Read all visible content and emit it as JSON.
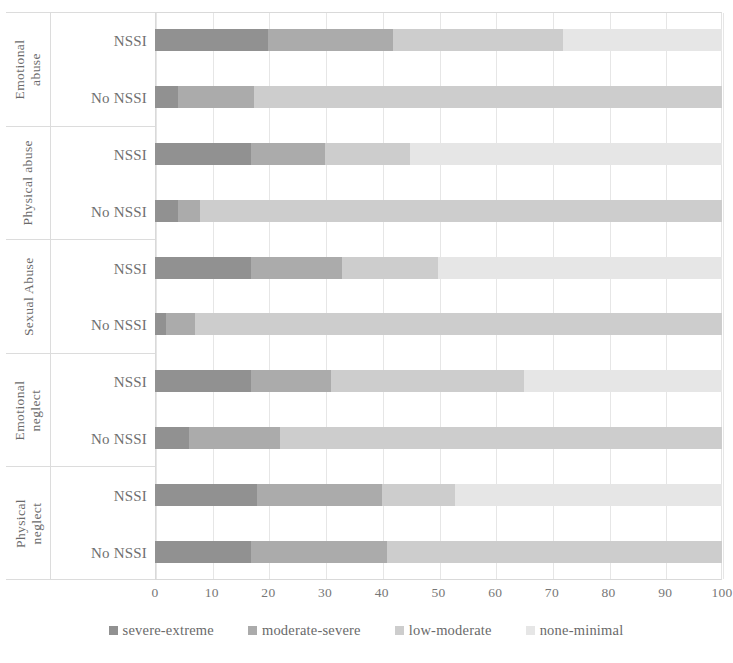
{
  "chart_data": {
    "type": "bar",
    "orientation": "horizontal",
    "stacked": true,
    "stack_mode": "percent",
    "title": "",
    "subtitle": "",
    "xlabel": "",
    "ylabel": "",
    "xlim": [
      0,
      100
    ],
    "xticks": [
      "0",
      "10",
      "20",
      "30",
      "40",
      "50",
      "60",
      "70",
      "80",
      "90",
      "100"
    ],
    "grid": "vertical",
    "legend_position": "bottom",
    "series": [
      {
        "name": "severe-extreme",
        "color": "#919191"
      },
      {
        "name": "moderate-severe",
        "color": "#ababab"
      },
      {
        "name": "low-moderate",
        "color": "#cdcdcd"
      },
      {
        "name": "none-minimal",
        "color": "#e6e6e6"
      }
    ],
    "groups": [
      {
        "category": "Emotional abuse",
        "category_lines": [
          "Emotional",
          "abuse"
        ],
        "rows": [
          {
            "label": "NSSI",
            "values": [
              20,
              22,
              30,
              28
            ]
          },
          {
            "label": "No NSSI",
            "values": [
              4,
              13.5,
              82.5,
              0
            ]
          }
        ]
      },
      {
        "category": "Physical abuse",
        "category_lines": [
          "Physical abuse",
          ""
        ],
        "rows": [
          {
            "label": "NSSI",
            "values": [
              17,
              13,
              15,
              55
            ]
          },
          {
            "label": "No NSSI",
            "values": [
              4,
              4,
              92,
              0
            ]
          }
        ]
      },
      {
        "category": "Sexual Abuse",
        "category_lines": [
          "Sexual Abuse",
          ""
        ],
        "rows": [
          {
            "label": "NSSI",
            "values": [
              17,
              16,
              17,
              50
            ]
          },
          {
            "label": "No NSSI",
            "values": [
              2,
              5,
              93,
              0
            ]
          }
        ]
      },
      {
        "category": "Emotional neglect",
        "category_lines": [
          "Emotional",
          "neglect"
        ],
        "rows": [
          {
            "label": "NSSI",
            "values": [
              17,
              14,
              34,
              35
            ]
          },
          {
            "label": "No NSSI",
            "values": [
              6,
              16,
              78,
              0
            ]
          }
        ]
      },
      {
        "category": "Physical neglect",
        "category_lines": [
          "Physical",
          "neglect"
        ],
        "rows": [
          {
            "label": "NSSI",
            "values": [
              18,
              22,
              13,
              47
            ]
          },
          {
            "label": "No NSSI",
            "values": [
              17,
              24,
              59,
              0
            ]
          }
        ]
      }
    ]
  }
}
